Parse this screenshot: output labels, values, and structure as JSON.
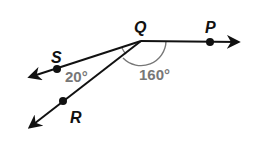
{
  "diagram": {
    "type": "geometry-angles",
    "vertex": {
      "label": "Q",
      "x": 141,
      "y": 41
    },
    "rays": [
      {
        "name": "QP",
        "end_x": 238,
        "end_y": 42,
        "point": {
          "label": "P",
          "x": 210,
          "y": 42
        }
      },
      {
        "name": "QS",
        "end_x": 30,
        "end_y": 77,
        "point": {
          "label": "S",
          "x": 57,
          "y": 69
        }
      },
      {
        "name": "QR",
        "end_x": 30,
        "end_y": 127,
        "point": {
          "label": "R",
          "x": 63,
          "y": 101
        }
      }
    ],
    "angles": [
      {
        "between": "SQR",
        "label": "20°"
      },
      {
        "between": "PQR",
        "label": "160°"
      }
    ],
    "colors": {
      "line": "#111111",
      "angle_label": "#777777",
      "arc": "#777777"
    }
  },
  "labels": {
    "Q": "Q",
    "P": "P",
    "S": "S",
    "R": "R",
    "angle_small": "20°",
    "angle_large": "160°"
  }
}
